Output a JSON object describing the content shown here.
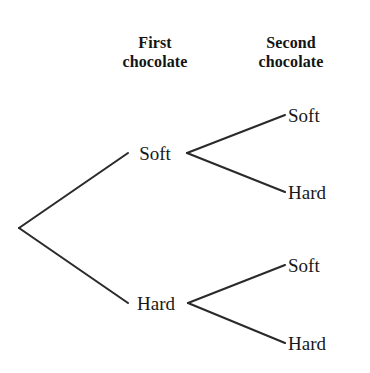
{
  "figure": {
    "type": "probability-tree-diagram",
    "background_color": "#ffffff",
    "line_color": "#2a2a2a",
    "text_color": "#181818",
    "width": 370,
    "height": 373
  },
  "headers": {
    "first": {
      "line1": "First",
      "line2": "chocolate"
    },
    "second": {
      "line1": "Second",
      "line2": "chocolate"
    }
  },
  "tree": {
    "root": {
      "x": 19,
      "y": 228
    },
    "level1": [
      {
        "label": "Soft",
        "anchor_x": 155,
        "anchor_y": 153,
        "branch_in": {
          "x1": 19,
          "y1": 228,
          "x2": 128,
          "y2": 153
        },
        "split_x": 187,
        "children": [
          {
            "label": "Soft",
            "end_x": 285,
            "end_y": 115,
            "branch": {
              "x1": 187,
              "y1": 153,
              "x2": 285,
              "y2": 115
            }
          },
          {
            "label": "Hard",
            "end_x": 285,
            "end_y": 192,
            "branch": {
              "x1": 187,
              "y1": 153,
              "x2": 285,
              "y2": 192
            }
          }
        ]
      },
      {
        "label": "Hard",
        "anchor_x": 156,
        "anchor_y": 303,
        "branch_in": {
          "x1": 19,
          "y1": 228,
          "x2": 128,
          "y2": 303
        },
        "split_x": 188,
        "children": [
          {
            "label": "Soft",
            "end_x": 285,
            "end_y": 265,
            "branch": {
              "x1": 188,
              "y1": 303,
              "x2": 285,
              "y2": 265
            }
          },
          {
            "label": "Hard",
            "end_x": 285,
            "end_y": 343,
            "branch": {
              "x1": 188,
              "y1": 303,
              "x2": 285,
              "y2": 343
            }
          }
        ]
      }
    ]
  }
}
